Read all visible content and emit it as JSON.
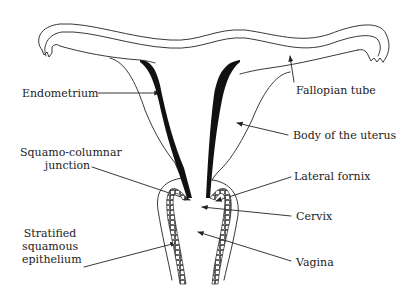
{
  "diagram": {
    "title": "",
    "colors": {
      "line": "#222222",
      "endometrium": "#111111",
      "background": "#ffffff",
      "text": "#222222"
    },
    "labels": [
      {
        "id": "endometrium",
        "text": "Endometrium",
        "side": "left"
      },
      {
        "id": "fallopian-tube",
        "text": "Fallopian tube",
        "side": "right"
      },
      {
        "id": "body-of-uterus",
        "text": "Body of the uterus",
        "side": "right"
      },
      {
        "id": "squamo-columnar-junction",
        "lines": [
          "Squamo-columnar",
          "junction"
        ],
        "side": "left"
      },
      {
        "id": "lateral-fornix",
        "text": "Lateral fornix",
        "side": "right"
      },
      {
        "id": "cervix",
        "text": "Cervix",
        "side": "right"
      },
      {
        "id": "stratified-squamous-epithelium",
        "lines": [
          "Stratified",
          "squamous",
          "epithelium"
        ],
        "side": "left"
      },
      {
        "id": "vagina",
        "text": "Vagina",
        "side": "right"
      }
    ]
  }
}
